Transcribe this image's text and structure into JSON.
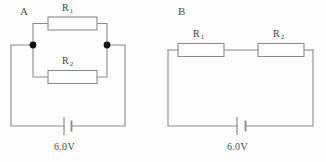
{
  "figure": {
    "type": "circuit-diagram",
    "background_color": "#fefefe",
    "wire_color": "#808080",
    "text_color": "#4a4a4a"
  },
  "circuits": [
    {
      "id": "A",
      "letter": "A",
      "arrangement": "parallel",
      "battery": {
        "label": "6.0V",
        "voltage": "6.0",
        "unit": "V"
      },
      "resistors": [
        {
          "id": "R1",
          "base": "R",
          "subscript": "1",
          "position": "top"
        },
        {
          "id": "R2",
          "base": "R",
          "subscript": "2",
          "position": "bottom"
        }
      ],
      "nodes": 2
    },
    {
      "id": "B",
      "letter": "B",
      "arrangement": "series",
      "battery": {
        "label": "6.0V",
        "voltage": "6.0",
        "unit": "V"
      },
      "resistors": [
        {
          "id": "R1",
          "base": "R",
          "subscript": "1",
          "position": "left"
        },
        {
          "id": "R2",
          "base": "R",
          "subscript": "2",
          "position": "right"
        }
      ],
      "nodes": 0
    }
  ]
}
